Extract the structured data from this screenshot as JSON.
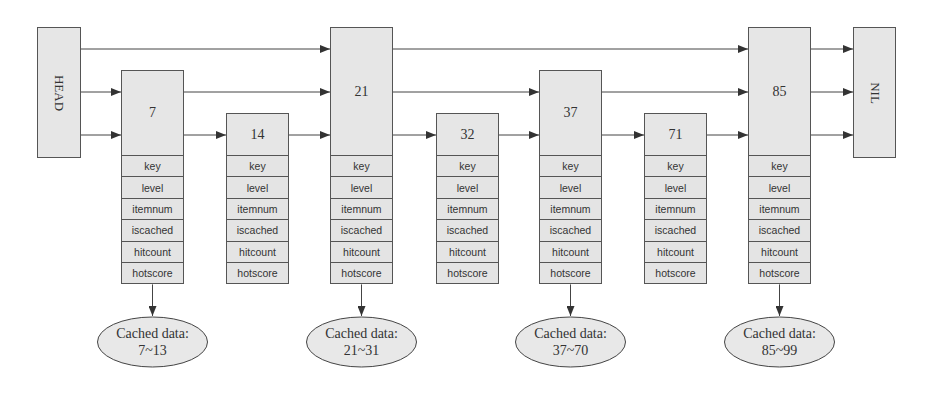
{
  "diagram": {
    "type": "skip-list-with-cache",
    "head_label": "HEAD",
    "nil_label": "NIL",
    "levels": 3,
    "nodes": [
      {
        "key": "7",
        "height": 2,
        "has_fields": true,
        "cached": "7~13"
      },
      {
        "key": "14",
        "height": 1,
        "has_fields": true,
        "cached": null
      },
      {
        "key": "21",
        "height": 3,
        "has_fields": true,
        "cached": "21~31"
      },
      {
        "key": "32",
        "height": 1,
        "has_fields": true,
        "cached": null
      },
      {
        "key": "37",
        "height": 2,
        "has_fields": true,
        "cached": "37~70"
      },
      {
        "key": "71",
        "height": 1,
        "has_fields": true,
        "cached": null
      },
      {
        "key": "85",
        "height": 3,
        "has_fields": true,
        "cached": "85~99"
      }
    ],
    "fields": [
      "key",
      "level",
      "itemnum",
      "iscached",
      "hitcount",
      "hotscore"
    ],
    "cache_label": "Cached data:",
    "colors": {
      "box_fill": "#e6e6e6",
      "stroke": "#555555",
      "text": "#333333",
      "ellipse_fill": "#e8e8e8"
    }
  }
}
